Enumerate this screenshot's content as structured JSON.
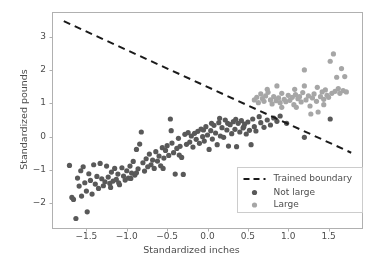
{
  "chart_data": {
    "type": "scatter",
    "title": "",
    "xlabel": "Standardized inches",
    "ylabel": "Standardized pounds",
    "xlim": [
      -1.92,
      1.92
    ],
    "ylim": [
      -2.75,
      3.72
    ],
    "xticks": [
      -1.5,
      -1.0,
      -0.5,
      0.0,
      0.5,
      1.0,
      1.5
    ],
    "xtick_labels": [
      "−1.5",
      "−1.0",
      "−0.5",
      "0.0",
      "0.5",
      "1.0",
      "1.5"
    ],
    "yticks": [
      -2,
      -1,
      0,
      1,
      2,
      3
    ],
    "ytick_labels": [
      "−2",
      "−1",
      "0",
      "1",
      "2",
      "3"
    ],
    "grid": false,
    "legend_position": "lower right",
    "colors": {
      "not_large": "#595959",
      "large": "#a6a6a6",
      "boundary": "#1a1a1a",
      "axes": "#b0b0b0",
      "text": "#4d4d4d",
      "background": "#ffffff"
    },
    "marker_size": 5.2,
    "boundary": {
      "label": "Trained boundary",
      "style": "dashed",
      "x_endpoints": [
        -1.78,
        1.78
      ],
      "y_endpoints": [
        3.46,
        -0.48
      ],
      "slope": -1.107,
      "intercept": 1.489
    },
    "series": [
      {
        "name": "Not large",
        "color": "#595959",
        "points": [
          [
            -1.71,
            -0.86
          ],
          [
            -1.68,
            -1.82
          ],
          [
            -1.66,
            -1.88
          ],
          [
            -1.63,
            -2.45
          ],
          [
            -1.61,
            -1.24
          ],
          [
            -1.59,
            -1.48
          ],
          [
            -1.57,
            -1.02
          ],
          [
            -1.56,
            -1.78
          ],
          [
            -1.54,
            -0.9
          ],
          [
            -1.52,
            -1.38
          ],
          [
            -1.5,
            -1.63
          ],
          [
            -1.49,
            -2.25
          ],
          [
            -1.47,
            -1.11
          ],
          [
            -1.45,
            -1.31
          ],
          [
            -1.43,
            -1.72
          ],
          [
            -1.41,
            -0.84
          ],
          [
            -1.39,
            -1.42
          ],
          [
            -1.37,
            -1.19
          ],
          [
            -1.35,
            -1.55
          ],
          [
            -1.33,
            -0.8
          ],
          [
            -1.31,
            -1.26
          ],
          [
            -1.29,
            -1.47
          ],
          [
            -1.27,
            -1.35
          ],
          [
            -1.25,
            -0.88
          ],
          [
            -1.23,
            -1.21
          ],
          [
            -1.21,
            -1.4
          ],
          [
            -1.19,
            -1.06
          ],
          [
            -1.17,
            -1.33
          ],
          [
            -1.15,
            -0.95
          ],
          [
            -1.13,
            -1.28
          ],
          [
            -1.11,
            -1.12
          ],
          [
            -1.09,
            -1.44
          ],
          [
            -1.06,
            -0.93
          ],
          [
            -1.04,
            -1.18
          ],
          [
            -1.02,
            -1.3
          ],
          [
            -1.0,
            -1.02
          ],
          [
            -0.98,
            -1.24
          ],
          [
            -0.96,
            -0.88
          ],
          [
            -0.94,
            -1.09
          ],
          [
            -0.92,
            -0.74
          ],
          [
            -0.9,
            -1.15
          ],
          [
            -0.88,
            -0.38
          ],
          [
            -0.86,
            -0.96
          ],
          [
            -0.84,
            -0.22
          ],
          [
            -0.82,
            0.14
          ],
          [
            -0.8,
            -0.78
          ],
          [
            -0.78,
            -1.03
          ],
          [
            -0.76,
            -0.66
          ],
          [
            -0.74,
            -0.9
          ],
          [
            -0.72,
            -0.52
          ],
          [
            -0.7,
            -0.84
          ],
          [
            -0.68,
            -0.7
          ],
          [
            -0.66,
            -0.95
          ],
          [
            -0.64,
            -0.45
          ],
          [
            -0.62,
            -0.73
          ],
          [
            -0.6,
            -0.58
          ],
          [
            -0.58,
            -0.87
          ],
          [
            -0.56,
            -0.33
          ],
          [
            -0.54,
            -0.64
          ],
          [
            -0.52,
            -0.41
          ],
          [
            -0.5,
            -0.27
          ],
          [
            -0.48,
            -0.56
          ],
          [
            -0.46,
            0.53
          ],
          [
            -0.45,
            0.18
          ],
          [
            -0.44,
            -0.19
          ],
          [
            -0.42,
            -0.48
          ],
          [
            -0.4,
            -1.12
          ],
          [
            -0.38,
            -0.35
          ],
          [
            -0.36,
            -0.05
          ],
          [
            -0.34,
            -0.29
          ],
          [
            -0.32,
            -0.62
          ],
          [
            -0.3,
            -1.13
          ],
          [
            -0.28,
            0.07
          ],
          [
            -0.26,
            -0.23
          ],
          [
            -0.24,
            0.12
          ],
          [
            -0.22,
            -0.16
          ],
          [
            -0.2,
            0.02
          ],
          [
            -0.18,
            -0.31
          ],
          [
            -0.16,
            0.1
          ],
          [
            -0.14,
            -0.08
          ],
          [
            -0.12,
            0.16
          ],
          [
            -0.1,
            -0.2
          ],
          [
            -0.08,
            0.23
          ],
          [
            -0.06,
            0.0
          ],
          [
            -0.04,
            -0.13
          ],
          [
            -0.02,
            0.3
          ],
          [
            0.0,
            0.05
          ],
          [
            0.02,
            -0.38
          ],
          [
            0.04,
            0.18
          ],
          [
            0.06,
            -0.07
          ],
          [
            0.08,
            0.34
          ],
          [
            0.1,
            0.11
          ],
          [
            0.12,
            -0.24
          ],
          [
            0.14,
            0.42
          ],
          [
            0.16,
            0.02
          ],
          [
            0.18,
            0.27
          ],
          [
            0.2,
            -0.02
          ],
          [
            0.22,
            0.5
          ],
          [
            0.24,
            0.2
          ],
          [
            0.26,
            -0.28
          ],
          [
            0.28,
            0.36
          ],
          [
            0.3,
            0.09
          ],
          [
            0.32,
            0.45
          ],
          [
            0.34,
            0.22
          ],
          [
            0.36,
            -0.3
          ],
          [
            0.38,
            0.4
          ],
          [
            0.4,
            0.14
          ],
          [
            0.42,
            0.48
          ],
          [
            0.44,
            0.26
          ],
          [
            0.46,
            0.38
          ],
          [
            0.48,
            0.08
          ],
          [
            0.5,
            0.44
          ],
          [
            0.52,
            0.19
          ],
          [
            0.54,
            -0.24
          ],
          [
            0.56,
            0.53
          ],
          [
            0.58,
            0.3
          ],
          [
            0.6,
            0.17
          ],
          [
            0.64,
            0.6
          ],
          [
            0.66,
            0.42
          ],
          [
            0.7,
            0.28
          ],
          [
            0.74,
            0.5
          ],
          [
            0.78,
            0.35
          ],
          [
            0.82,
            0.56
          ],
          [
            0.86,
            0.46
          ],
          [
            0.9,
            0.62
          ],
          [
            0.98,
            0.4
          ],
          [
            1.2,
            -0.02
          ],
          [
            1.52,
            0.53
          ],
          [
            -1.2,
            -1.52
          ],
          [
            -1.1,
            -1.38
          ],
          [
            -0.95,
            -1.25
          ],
          [
            -0.88,
            -1.08
          ],
          [
            -0.55,
            -0.95
          ],
          [
            -0.35,
            -0.55
          ],
          [
            0.15,
            0.55
          ],
          [
            0.35,
            0.52
          ],
          [
            0.45,
            0.3
          ],
          [
            0.25,
            0.4
          ],
          [
            0.05,
            0.4
          ],
          [
            -0.05,
            0.2
          ]
        ]
      },
      {
        "name": "Large",
        "color": "#a6a6a6",
        "points": [
          [
            0.58,
            1.1
          ],
          [
            0.61,
            1.18
          ],
          [
            0.63,
            1.02
          ],
          [
            0.66,
            1.28
          ],
          [
            0.68,
            1.14
          ],
          [
            0.7,
            1.06
          ],
          [
            0.72,
            1.22
          ],
          [
            0.75,
            1.33
          ],
          [
            0.78,
            1.1
          ],
          [
            0.8,
            0.98
          ],
          [
            0.82,
            1.2
          ],
          [
            0.85,
            1.08
          ],
          [
            0.88,
            1.16
          ],
          [
            0.9,
            1.02
          ],
          [
            0.92,
            1.3
          ],
          [
            0.95,
            1.12
          ],
          [
            0.97,
            1.05
          ],
          [
            1.0,
            1.24
          ],
          [
            1.02,
            1.09
          ],
          [
            1.05,
            1.18
          ],
          [
            1.07,
            0.96
          ],
          [
            1.09,
            1.26
          ],
          [
            1.12,
            1.14
          ],
          [
            1.14,
            1.2
          ],
          [
            1.16,
            1.04
          ],
          [
            1.18,
            1.32
          ],
          [
            1.2,
            1.52
          ],
          [
            1.2,
            2.0
          ],
          [
            1.22,
            1.1
          ],
          [
            1.25,
            1.22
          ],
          [
            1.27,
            0.92
          ],
          [
            1.3,
            1.16
          ],
          [
            1.32,
            1.28
          ],
          [
            1.35,
            1.06
          ],
          [
            1.37,
            0.74
          ],
          [
            1.4,
            1.2
          ],
          [
            1.42,
            1.34
          ],
          [
            1.44,
            1.12
          ],
          [
            1.46,
            1.4
          ],
          [
            1.48,
            1.24
          ],
          [
            1.5,
            1.18
          ],
          [
            1.52,
            2.26
          ],
          [
            1.54,
            1.3
          ],
          [
            1.56,
            2.48
          ],
          [
            1.58,
            1.36
          ],
          [
            1.6,
            1.78
          ],
          [
            1.62,
            1.44
          ],
          [
            1.64,
            1.3
          ],
          [
            1.66,
            2.04
          ],
          [
            1.68,
            1.38
          ],
          [
            1.7,
            1.8
          ],
          [
            1.72,
            1.34
          ],
          [
            0.74,
            1.42
          ],
          [
            0.86,
            1.52
          ],
          [
            1.08,
            1.42
          ],
          [
            1.36,
            1.48
          ],
          [
            0.92,
            0.88
          ],
          [
            1.1,
            0.88
          ],
          [
            1.28,
            0.68
          ],
          [
            1.44,
            0.96
          ]
        ]
      }
    ]
  },
  "legend": {
    "entries": [
      {
        "label": "Trained boundary",
        "marker": "dashed-line",
        "color": "#1a1a1a"
      },
      {
        "label": "Not large",
        "marker": "circle",
        "color": "#595959"
      },
      {
        "label": "Large",
        "marker": "circle",
        "color": "#a6a6a6"
      }
    ]
  }
}
